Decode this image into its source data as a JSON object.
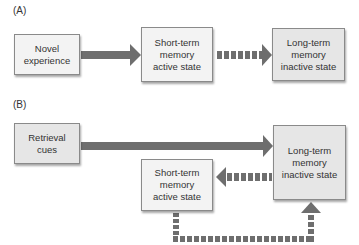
{
  "panel_a": {
    "label": "(A)",
    "boxes": {
      "novel": "Novel\nexperience",
      "stm": "Short-term\nmemory\nactive state",
      "ltm": "Long-term\nmemory\ninactive state"
    }
  },
  "panel_b": {
    "label": "(B)",
    "boxes": {
      "cues": "Retrieval\ncues",
      "stm": "Short-term\nmemory\nactive state",
      "ltm": "Long-term\nmemory\ninactive state"
    }
  },
  "colors": {
    "arrow": "#6e6e6e",
    "box_light": "#f3f3f3",
    "box_mid": "#e6e6e6"
  }
}
